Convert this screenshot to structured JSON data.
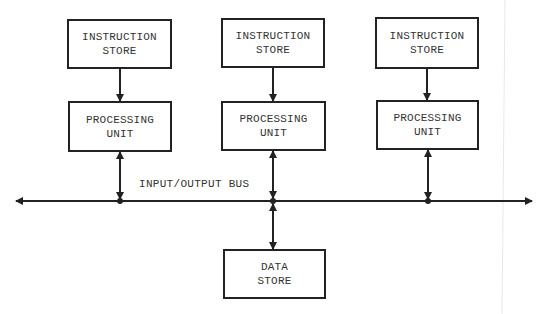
{
  "diagram": {
    "instruction_stores": [
      {
        "line1": "INSTRUCTION",
        "line2": "STORE"
      },
      {
        "line1": "INSTRUCTION",
        "line2": "STORE"
      },
      {
        "line1": "INSTRUCTION",
        "line2": "STORE"
      }
    ],
    "processing_units": [
      {
        "line1": "PROCESSING",
        "line2": "UNIT"
      },
      {
        "line1": "PROCESSING",
        "line2": "UNIT"
      },
      {
        "line1": "PROCESSING",
        "line2": "UNIT"
      }
    ],
    "bus_label": "INPUT/OUTPUT BUS",
    "data_store": {
      "line1": "DATA",
      "line2": "STORE"
    },
    "colors": {
      "stroke": "#222222",
      "text": "#333333",
      "background": "#ffffff"
    }
  }
}
